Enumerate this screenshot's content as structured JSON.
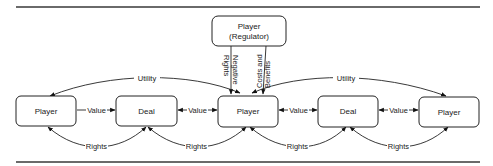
{
  "nodes": {
    "regulator": {
      "line1": "Player",
      "line2": "(Regulator)"
    },
    "player_left": {
      "label": "Player"
    },
    "deal_left": {
      "label": "Deal"
    },
    "player_center": {
      "label": "Player"
    },
    "deal_right": {
      "label": "Deal"
    },
    "player_right": {
      "label": "Player"
    }
  },
  "edges": {
    "negative_rights": {
      "line1": "Negative",
      "line2": "Rights"
    },
    "costs_benefits": {
      "line1": "Costs and",
      "line2": "Benefits"
    },
    "utility_left": "Utility",
    "utility_right": "Utility",
    "value_1": "Value",
    "value_2": "Value",
    "value_3": "Value",
    "value_4": "Value",
    "rights_1": "Rights",
    "rights_2": "Rights",
    "rights_3": "Rights",
    "rights_4": "Rights"
  }
}
